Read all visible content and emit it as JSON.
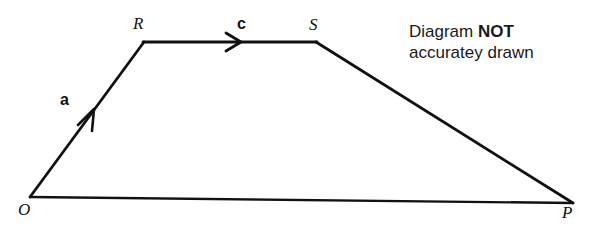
{
  "figure": {
    "type": "geometry-vector-diagram",
    "shape": "quadrilateral",
    "stroke_color": "#111111",
    "background_color": "#ffffff",
    "vertices": [
      {
        "id": "O",
        "label": "O",
        "x": 30,
        "y": 197,
        "label_x": 18,
        "label_y": 202
      },
      {
        "id": "R",
        "label": "R",
        "x": 144,
        "y": 42,
        "label_x": 133,
        "label_y": 16
      },
      {
        "id": "S",
        "label": "S",
        "x": 316,
        "y": 42,
        "label_x": 309,
        "label_y": 17
      },
      {
        "id": "P",
        "label": "P",
        "x": 573,
        "y": 203,
        "label_x": 562,
        "label_y": 205
      }
    ],
    "edges": [
      {
        "id": "OR",
        "from": "O",
        "to": "R",
        "arrow": true,
        "vector_label": "a",
        "label_x": 60,
        "label_y": 92
      },
      {
        "id": "RS",
        "from": "R",
        "to": "S",
        "arrow": true,
        "vector_label": "c",
        "label_x": 237,
        "label_y": 17
      },
      {
        "id": "SP",
        "from": "S",
        "to": "P",
        "arrow": false,
        "vector_label": "",
        "label_x": 0,
        "label_y": 0
      },
      {
        "id": "OP",
        "from": "O",
        "to": "P",
        "arrow": false,
        "vector_label": "",
        "label_x": 0,
        "label_y": 0
      }
    ]
  },
  "note": {
    "line1_prefix": "Diagram ",
    "line1_emphasis": "NOT",
    "line2": "accuratey drawn"
  }
}
